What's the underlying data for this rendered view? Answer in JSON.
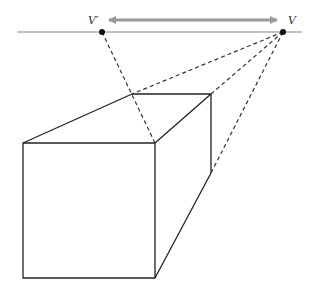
{
  "diagram": {
    "type": "two-point perspective box",
    "labels": {
      "vanishing_point_left": "V′",
      "vanishing_point_right": "V"
    },
    "colors": {
      "background": "#ffffff",
      "horizon_line": "#888888",
      "arrow": "#999999",
      "edges": "#222222",
      "construction_lines": "#333333",
      "points": "#111111"
    },
    "horizon": {
      "x1": 17,
      "y": 32,
      "x2": 302
    },
    "arrow": {
      "x1": 107,
      "x2": 279,
      "y": 20,
      "double_headed": true
    },
    "points": {
      "V_prime": {
        "x": 102,
        "y": 32
      },
      "V": {
        "x": 283,
        "y": 32
      }
    },
    "box": {
      "front_face": {
        "x1": 23,
        "y1": 143,
        "x2": 155,
        "y2": 278
      },
      "back_left_top": {
        "x": 132,
        "y": 94
      },
      "back_right_top": {
        "x": 211,
        "y": 94
      },
      "back_right_bottom": {
        "x": 211,
        "y": 173
      }
    }
  }
}
